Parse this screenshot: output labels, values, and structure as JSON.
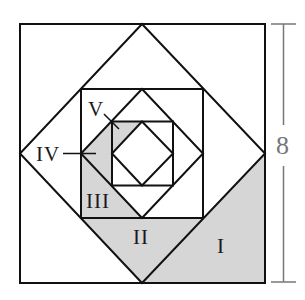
{
  "figure": {
    "type": "nested squares and diamonds",
    "outer_square_side": "8",
    "colors": {
      "line": "#111111",
      "shade": "#d6d6d6",
      "dimension": "#777777",
      "background": "#ffffff"
    },
    "regions": [
      {
        "id": "I",
        "label": "I",
        "description": "triangle between outer square bottom-right corner and first diamond"
      },
      {
        "id": "II",
        "label": "II",
        "description": "triangle between second square bottom edge and first diamond"
      },
      {
        "id": "III",
        "label": "III",
        "description": "triangle between second square bottom-left corner and second diamond"
      },
      {
        "id": "IV",
        "label": "IV",
        "description": "triangle between second diamond left vertex and third square"
      },
      {
        "id": "V",
        "label": "V",
        "description": "triangle in third square top-left corner"
      }
    ]
  },
  "labels": {
    "I": "I",
    "II": "II",
    "III": "III",
    "IV": "IV",
    "V": "V",
    "dimension": "8"
  }
}
